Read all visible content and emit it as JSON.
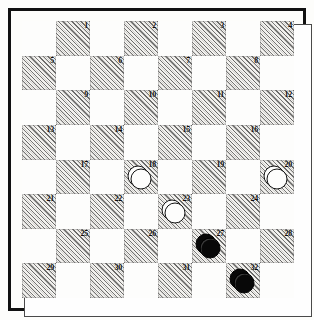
{
  "diagram": {
    "board": {
      "rows": 8,
      "columns": 8,
      "numbering_scheme": "standard-draughts-1-to-32",
      "dark_square_style": "diagonal-hatch",
      "numbered_squares_only": "dark",
      "number_position": "top-right"
    },
    "squares": [
      {
        "n": 1,
        "row": 1,
        "col": 2,
        "shade": "dark"
      },
      {
        "n": 2,
        "row": 1,
        "col": 4,
        "shade": "dark"
      },
      {
        "n": 3,
        "row": 1,
        "col": 6,
        "shade": "dark"
      },
      {
        "n": 4,
        "row": 1,
        "col": 8,
        "shade": "dark"
      },
      {
        "n": 5,
        "row": 2,
        "col": 1,
        "shade": "dark"
      },
      {
        "n": 6,
        "row": 2,
        "col": 3,
        "shade": "dark"
      },
      {
        "n": 7,
        "row": 2,
        "col": 5,
        "shade": "dark"
      },
      {
        "n": 8,
        "row": 2,
        "col": 7,
        "shade": "dark"
      },
      {
        "n": 9,
        "row": 3,
        "col": 2,
        "shade": "dark"
      },
      {
        "n": 10,
        "row": 3,
        "col": 4,
        "shade": "dark"
      },
      {
        "n": 11,
        "row": 3,
        "col": 6,
        "shade": "dark"
      },
      {
        "n": 12,
        "row": 3,
        "col": 8,
        "shade": "dark"
      },
      {
        "n": 13,
        "row": 4,
        "col": 1,
        "shade": "dark"
      },
      {
        "n": 14,
        "row": 4,
        "col": 3,
        "shade": "dark"
      },
      {
        "n": 15,
        "row": 4,
        "col": 5,
        "shade": "dark"
      },
      {
        "n": 16,
        "row": 4,
        "col": 7,
        "shade": "dark"
      },
      {
        "n": 17,
        "row": 5,
        "col": 2,
        "shade": "dark"
      },
      {
        "n": 18,
        "row": 5,
        "col": 4,
        "shade": "dark"
      },
      {
        "n": 19,
        "row": 5,
        "col": 6,
        "shade": "dark"
      },
      {
        "n": 20,
        "row": 5,
        "col": 8,
        "shade": "dark"
      },
      {
        "n": 21,
        "row": 6,
        "col": 1,
        "shade": "dark"
      },
      {
        "n": 22,
        "row": 6,
        "col": 3,
        "shade": "dark"
      },
      {
        "n": 23,
        "row": 6,
        "col": 5,
        "shade": "dark"
      },
      {
        "n": 24,
        "row": 6,
        "col": 7,
        "shade": "dark"
      },
      {
        "n": 25,
        "row": 7,
        "col": 2,
        "shade": "dark"
      },
      {
        "n": 26,
        "row": 7,
        "col": 4,
        "shade": "dark"
      },
      {
        "n": 27,
        "row": 7,
        "col": 6,
        "shade": "dark"
      },
      {
        "n": 28,
        "row": 7,
        "col": 8,
        "shade": "dark"
      },
      {
        "n": 29,
        "row": 8,
        "col": 1,
        "shade": "dark"
      },
      {
        "n": 30,
        "row": 8,
        "col": 3,
        "shade": "dark"
      },
      {
        "n": 31,
        "row": 8,
        "col": 5,
        "shade": "dark"
      },
      {
        "n": 32,
        "row": 8,
        "col": 7,
        "shade": "dark"
      }
    ],
    "pieces": [
      {
        "square": 18,
        "color": "white",
        "rank": "king"
      },
      {
        "square": 20,
        "color": "white",
        "rank": "king"
      },
      {
        "square": 23,
        "color": "white",
        "rank": "king"
      },
      {
        "square": 27,
        "color": "black",
        "rank": "king"
      },
      {
        "square": 32,
        "color": "black",
        "rank": "king"
      }
    ],
    "counts": {
      "white_pieces": 3,
      "black_pieces": 2,
      "total_pieces": 5
    },
    "colors": {
      "page_background": "#fdfdfb",
      "frame": "#111111",
      "inner_rule": "#4a4a4a",
      "light_square": "#fdfdfc",
      "dark_square_hatch": "#282828",
      "dark_square_base": "#f2f1ee",
      "black_piece": "#080808",
      "white_piece": "#fdfdfc",
      "number_text": "#0b0b0b"
    }
  }
}
